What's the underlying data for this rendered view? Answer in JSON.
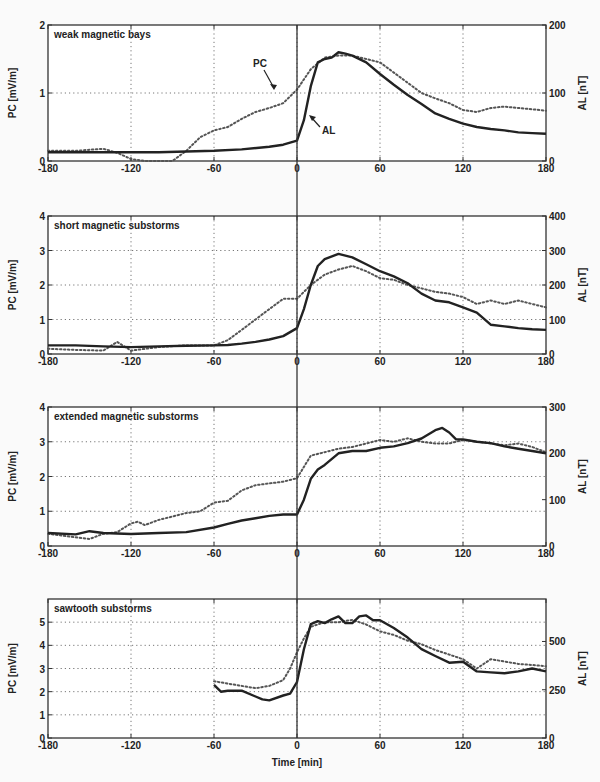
{
  "figure": {
    "xlabel": "Time [min]",
    "x_ticks": [
      -180,
      -120,
      -60,
      0,
      60,
      120,
      180
    ],
    "annotations": [
      {
        "panel": 0,
        "text": "PC",
        "series": "PC"
      },
      {
        "panel": 0,
        "text": "AL",
        "series": "AL"
      }
    ]
  },
  "chart_data": [
    {
      "type": "line",
      "title": "weak magnetic bays",
      "xlabel": "Time [min]",
      "ylabel": "PC [mV/m]",
      "ylabel_right": "AL [nT]",
      "xlim": [
        -180,
        180
      ],
      "ylim": [
        0,
        2
      ],
      "ylim_right": [
        0,
        200
      ],
      "yticks": [
        0,
        1,
        2
      ],
      "yticks_right": [
        0,
        100,
        200
      ],
      "grid": true,
      "series": [
        {
          "name": "PC",
          "axis": "left",
          "style": "dotted",
          "x": [
            -180,
            -160,
            -140,
            -130,
            -120,
            -110,
            -100,
            -90,
            -80,
            -70,
            -60,
            -50,
            -40,
            -30,
            -20,
            -10,
            0,
            10,
            20,
            30,
            40,
            50,
            60,
            70,
            80,
            90,
            100,
            110,
            120,
            130,
            140,
            150,
            160,
            170,
            180
          ],
          "y": [
            0.15,
            0.15,
            0.18,
            0.12,
            0.03,
            -0.05,
            -0.1,
            0.0,
            0.15,
            0.35,
            0.45,
            0.5,
            0.62,
            0.72,
            0.78,
            0.85,
            1.05,
            1.35,
            1.52,
            1.55,
            1.55,
            1.5,
            1.45,
            1.3,
            1.15,
            1.0,
            0.92,
            0.85,
            0.75,
            0.72,
            0.78,
            0.8,
            0.78,
            0.76,
            0.74
          ]
        },
        {
          "name": "AL",
          "axis": "right",
          "style": "solid",
          "x": [
            -180,
            -160,
            -140,
            -120,
            -100,
            -80,
            -60,
            -40,
            -20,
            -10,
            0,
            5,
            10,
            15,
            20,
            25,
            30,
            35,
            40,
            50,
            60,
            70,
            80,
            90,
            100,
            110,
            120,
            130,
            140,
            150,
            160,
            170,
            180
          ],
          "y": [
            13,
            13,
            13,
            13,
            13,
            14,
            15,
            17,
            21,
            24,
            30,
            60,
            110,
            145,
            150,
            152,
            160,
            158,
            155,
            145,
            128,
            112,
            97,
            84,
            70,
            62,
            55,
            50,
            47,
            45,
            42,
            41,
            40
          ]
        }
      ]
    },
    {
      "type": "line",
      "title": "short magnetic substorms",
      "xlabel": "Time [min]",
      "ylabel": "PC [mV/m]",
      "ylabel_right": "AL [nT]",
      "xlim": [
        -180,
        180
      ],
      "ylim": [
        0,
        4
      ],
      "ylim_right": [
        0,
        400
      ],
      "yticks": [
        0,
        1,
        2,
        3,
        4
      ],
      "yticks_right": [
        0,
        100,
        200,
        300,
        400
      ],
      "grid": true,
      "series": [
        {
          "name": "PC",
          "axis": "left",
          "style": "dotted",
          "x": [
            -180,
            -160,
            -140,
            -130,
            -120,
            -100,
            -80,
            -60,
            -50,
            -40,
            -30,
            -20,
            -10,
            0,
            10,
            20,
            30,
            40,
            50,
            60,
            70,
            80,
            90,
            100,
            110,
            120,
            130,
            140,
            150,
            160,
            170,
            180
          ],
          "y": [
            0.15,
            0.12,
            0.1,
            0.35,
            0.1,
            0.2,
            0.25,
            0.25,
            0.4,
            0.7,
            1.0,
            1.3,
            1.6,
            1.6,
            2.0,
            2.3,
            2.45,
            2.55,
            2.4,
            2.2,
            2.15,
            2.0,
            1.9,
            1.8,
            1.75,
            1.65,
            1.45,
            1.55,
            1.45,
            1.55,
            1.45,
            1.35
          ]
        },
        {
          "name": "AL",
          "axis": "right",
          "style": "solid",
          "x": [
            -180,
            -160,
            -140,
            -120,
            -100,
            -80,
            -60,
            -50,
            -40,
            -30,
            -20,
            -10,
            0,
            5,
            10,
            15,
            20,
            30,
            40,
            50,
            60,
            70,
            80,
            90,
            100,
            110,
            120,
            130,
            140,
            150,
            160,
            170,
            180
          ],
          "y": [
            25,
            25,
            22,
            20,
            22,
            24,
            25,
            26,
            30,
            35,
            42,
            52,
            75,
            130,
            200,
            255,
            275,
            290,
            280,
            260,
            240,
            225,
            205,
            175,
            155,
            150,
            135,
            120,
            85,
            80,
            75,
            72,
            70
          ]
        }
      ]
    },
    {
      "type": "line",
      "title": "extended magnetic substorms",
      "xlabel": "Time [min]",
      "ylabel": "PC [mV/m]",
      "ylabel_right": "AL [nT]",
      "xlim": [
        -180,
        180
      ],
      "ylim": [
        0,
        4
      ],
      "ylim_right": [
        0,
        300
      ],
      "yticks": [
        0,
        1,
        2,
        3,
        4
      ],
      "yticks_right": [
        0,
        100,
        200,
        300
      ],
      "grid": true,
      "series": [
        {
          "name": "PC",
          "axis": "left",
          "style": "dotted",
          "x": [
            -180,
            -170,
            -160,
            -150,
            -140,
            -130,
            -120,
            -115,
            -110,
            -100,
            -90,
            -80,
            -70,
            -60,
            -50,
            -40,
            -30,
            -20,
            -10,
            0,
            10,
            20,
            30,
            40,
            50,
            60,
            70,
            80,
            90,
            100,
            110,
            120,
            130,
            140,
            150,
            160,
            170,
            180
          ],
          "y": [
            0.35,
            0.3,
            0.25,
            0.2,
            0.35,
            0.4,
            0.65,
            0.7,
            0.6,
            0.75,
            0.85,
            0.95,
            1.0,
            1.25,
            1.3,
            1.6,
            1.75,
            1.8,
            1.85,
            1.95,
            2.6,
            2.7,
            2.8,
            2.85,
            2.95,
            3.05,
            3.0,
            3.1,
            3.0,
            2.95,
            2.95,
            3.05,
            3.0,
            2.95,
            2.9,
            2.95,
            2.85,
            2.7
          ]
        },
        {
          "name": "AL",
          "axis": "right",
          "style": "solid",
          "x": [
            -180,
            -160,
            -150,
            -140,
            -120,
            -100,
            -80,
            -60,
            -50,
            -40,
            -30,
            -20,
            -10,
            0,
            5,
            10,
            15,
            20,
            30,
            40,
            50,
            60,
            70,
            80,
            90,
            100,
            105,
            110,
            115,
            120,
            130,
            140,
            150,
            160,
            170,
            180
          ],
          "y": [
            28,
            25,
            32,
            28,
            26,
            28,
            30,
            40,
            48,
            55,
            60,
            65,
            68,
            68,
            100,
            145,
            165,
            175,
            200,
            205,
            205,
            212,
            215,
            222,
            232,
            250,
            255,
            245,
            230,
            230,
            225,
            222,
            215,
            210,
            205,
            200
          ]
        }
      ]
    },
    {
      "type": "line",
      "title": "sawtooth substorms",
      "xlabel": "Time [min]",
      "ylabel": "PC [mV/m]",
      "ylabel_right": "AL [nT]",
      "xlim": [
        -180,
        180
      ],
      "ylim": [
        0,
        6
      ],
      "ylim_right": [
        0,
        720
      ],
      "yticks": [
        0,
        1,
        2,
        3,
        4,
        5
      ],
      "yticks_right": [
        0,
        250,
        500
      ],
      "grid": true,
      "series": [
        {
          "name": "PC",
          "axis": "left",
          "style": "dotted",
          "x": [
            -60,
            -50,
            -40,
            -30,
            -20,
            -10,
            -5,
            0,
            5,
            10,
            20,
            30,
            40,
            50,
            60,
            70,
            80,
            90,
            100,
            110,
            120,
            130,
            140,
            150,
            160,
            170,
            180
          ],
          "y": [
            2.45,
            2.35,
            2.25,
            2.15,
            2.25,
            2.5,
            3.0,
            3.7,
            4.3,
            4.8,
            5.0,
            5.0,
            5.1,
            4.9,
            4.6,
            4.45,
            4.2,
            4.05,
            3.8,
            3.6,
            3.4,
            3.0,
            3.4,
            3.3,
            3.2,
            3.15,
            3.1
          ]
        },
        {
          "name": "AL",
          "axis": "right",
          "style": "solid",
          "x": [
            -60,
            -55,
            -50,
            -40,
            -30,
            -25,
            -20,
            -10,
            -5,
            0,
            5,
            10,
            15,
            20,
            25,
            30,
            35,
            40,
            45,
            50,
            55,
            60,
            70,
            80,
            90,
            100,
            110,
            120,
            130,
            140,
            150,
            160,
            170,
            180
          ],
          "y": [
            275,
            240,
            245,
            245,
            215,
            200,
            195,
            220,
            230,
            290,
            460,
            590,
            605,
            595,
            615,
            630,
            595,
            595,
            630,
            635,
            610,
            610,
            570,
            520,
            460,
            425,
            390,
            395,
            345,
            340,
            335,
            345,
            360,
            345
          ]
        }
      ]
    }
  ]
}
